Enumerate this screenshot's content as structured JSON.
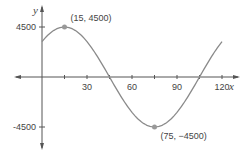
{
  "chart_data": {
    "type": "line",
    "title": "",
    "xlabel": "x",
    "ylabel": "y",
    "xlim": [
      -28,
      130
    ],
    "ylim": [
      -4500,
      4500
    ],
    "x_ticks": [
      30,
      60,
      90,
      120
    ],
    "x_tick_minor": [
      15,
      45,
      75,
      105
    ],
    "y_ticks": [
      4500,
      -4500
    ],
    "x_tick_labels": [
      "30",
      "60",
      "90",
      "120"
    ],
    "y_tick_labels": [
      "4500",
      "-4500"
    ],
    "grid": false,
    "legend": null,
    "series": [
      {
        "name": "y = 4500 cos(2π(x − 15)/120)",
        "color": "#888888",
        "x": [
          0,
          15,
          45,
          75,
          105,
          120
        ],
        "y": [
          3182,
          4500,
          0,
          -4500,
          0,
          3182
        ]
      }
    ],
    "annotations": [
      {
        "x": 15,
        "y": 4500,
        "text": "(15, 4500)"
      },
      {
        "x": 75,
        "y": -4500,
        "text": "(75, −4500)"
      }
    ]
  },
  "axes": {
    "x_name": "x",
    "y_name": "y",
    "axis_color": "#555555",
    "curve_color": "#8a8a8a",
    "point_color": "#999999"
  }
}
